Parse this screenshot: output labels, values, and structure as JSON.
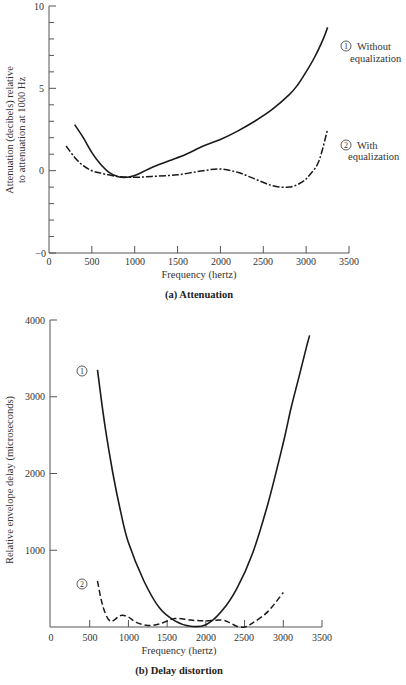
{
  "chart_data": [
    {
      "type": "line",
      "title": "(a) Attenuation",
      "xlabel": "Frequency (hertz)",
      "ylabel": "Attenuation (decibels) relative to attenuation at 1000 Hz",
      "xlim": [
        0,
        3500
      ],
      "ylim": [
        -5,
        10
      ],
      "xticks": [
        "0",
        "500",
        "1000",
        "1500",
        "2000",
        "2500",
        "3000",
        "3500"
      ],
      "yticks": [
        "−0",
        "0",
        "5",
        "10"
      ],
      "grid": false,
      "series": [
        {
          "name": "① Without equalization",
          "style": "solid",
          "x": [
            300,
            400,
            500,
            600,
            700,
            800,
            900,
            1000,
            1200,
            1400,
            1600,
            1800,
            2000,
            2200,
            2400,
            2600,
            2800,
            2900,
            3000,
            3100,
            3200,
            3250
          ],
          "y": [
            2.8,
            2.0,
            1.1,
            0.4,
            -0.1,
            -0.35,
            -0.4,
            -0.3,
            0.2,
            0.6,
            1.0,
            1.5,
            1.9,
            2.4,
            3.0,
            3.7,
            4.6,
            5.2,
            6.0,
            6.9,
            8.0,
            8.7
          ]
        },
        {
          "name": "② With equalization",
          "style": "dash-dot",
          "x": [
            200,
            300,
            400,
            500,
            600,
            800,
            1000,
            1200,
            1500,
            1800,
            2000,
            2200,
            2400,
            2600,
            2800,
            2950,
            3050,
            3150,
            3250
          ],
          "y": [
            1.5,
            0.8,
            0.3,
            0.0,
            -0.15,
            -0.35,
            -0.4,
            -0.35,
            -0.25,
            0.0,
            0.1,
            -0.1,
            -0.5,
            -0.9,
            -1.0,
            -0.7,
            -0.2,
            0.6,
            2.5
          ]
        }
      ]
    },
    {
      "type": "line",
      "title": "(b) Delay distortion",
      "xlabel": "Frequency (hertz)",
      "ylabel": "Relative envelope delay (microseconds)",
      "xlim": [
        0,
        3500
      ],
      "ylim": [
        0,
        4000
      ],
      "xticks": [
        "0",
        "500",
        "1000",
        "1500",
        "2000",
        "2500",
        "3000",
        "3500"
      ],
      "yticks": [
        "1000",
        "2000",
        "3000",
        "4000"
      ],
      "grid": false,
      "series": [
        {
          "name": "①",
          "style": "solid",
          "x": [
            600,
            700,
            800,
            900,
            1000,
            1200,
            1400,
            1600,
            1800,
            2000,
            2200,
            2400,
            2600,
            2800,
            3000,
            3100,
            3200,
            3300,
            3340
          ],
          "y": [
            3350,
            2600,
            2000,
            1500,
            1100,
            600,
            250,
            80,
            10,
            30,
            200,
            500,
            950,
            1600,
            2400,
            2850,
            3250,
            3650,
            3800
          ]
        },
        {
          "name": "②",
          "style": "dashed",
          "x": [
            600,
            650,
            700,
            750,
            800,
            900,
            1000,
            1100,
            1250,
            1400,
            1600,
            1800,
            2000,
            2200,
            2300,
            2400,
            2500,
            2600,
            2800,
            3000
          ],
          "y": [
            600,
            350,
            180,
            90,
            80,
            150,
            130,
            60,
            20,
            40,
            110,
            90,
            80,
            90,
            60,
            10,
            0,
            50,
            200,
            450
          ]
        }
      ]
    }
  ],
  "chart_a": {
    "yticks": [
      {
        "v": 10,
        "label": "10"
      },
      {
        "v": 5,
        "label": "5"
      },
      {
        "v": 0,
        "label": "0"
      },
      {
        "v": -5,
        "label": "−0"
      }
    ],
    "xticks": [
      "0",
      "500",
      "1000",
      "1500",
      "2000",
      "2500",
      "3000",
      "3500"
    ],
    "ylabel_line1": "Attenuation (decibels) relative",
    "ylabel_line2": "to attenuation at 1000 Hz",
    "xlabel": "Frequency (hertz)",
    "caption": "(a) Attenuation",
    "legend1_num": "1",
    "legend1_line1": "Without",
    "legend1_line2": "equalization",
    "legend2_num": "2",
    "legend2_line1": "With",
    "legend2_line2": "equalization"
  },
  "chart_b": {
    "yticks": [
      "4000",
      "3000",
      "2000",
      "1000"
    ],
    "xticks": [
      "0",
      "500",
      "1000",
      "1500",
      "2000",
      "2500",
      "3000",
      "3500"
    ],
    "ylabel": "Relative envelope delay (microseconds)",
    "xlabel": "Frequency (hertz)",
    "caption": "(b) Delay distortion",
    "marker1": "1",
    "marker2": "2"
  }
}
